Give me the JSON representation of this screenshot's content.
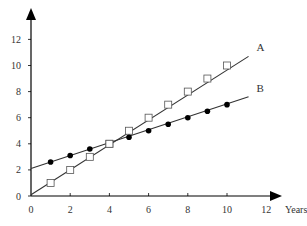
{
  "chart_data": {
    "type": "line",
    "title": "",
    "xlabel": "Years",
    "ylabel": "",
    "xlim": [
      0,
      12
    ],
    "ylim": [
      0,
      13
    ],
    "x_ticks": [
      0,
      2,
      4,
      6,
      8,
      10,
      12
    ],
    "y_ticks": [
      0,
      2,
      4,
      6,
      8,
      10,
      12
    ],
    "grid": false,
    "legend": "inline labels at line ends",
    "x": [
      1,
      2,
      3,
      4,
      5,
      6,
      7,
      8,
      9,
      10
    ],
    "series": [
      {
        "name": "A",
        "marker": "open-square",
        "values": [
          1,
          2,
          3,
          4,
          5,
          6,
          7,
          8,
          9,
          10
        ],
        "line_start": [
          0,
          0.1
        ],
        "line_end": [
          11.1,
          10.7
        ]
      },
      {
        "name": "B",
        "marker": "filled-circle",
        "values": [
          2.6,
          3.1,
          3.6,
          4.0,
          4.5,
          5.0,
          5.5,
          6.0,
          6.5,
          7.0
        ],
        "line_start": [
          0,
          2.1
        ],
        "line_end": [
          11.1,
          7.6
        ]
      }
    ]
  },
  "colors": {
    "axis": "#000000",
    "line": "#333333",
    "text": "#333333"
  }
}
